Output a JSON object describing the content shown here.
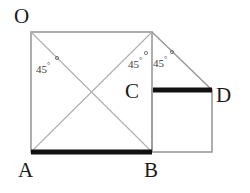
{
  "figure": {
    "type": "geometry-diagram",
    "colors": {
      "thin_line": "#9a9a9a",
      "thick_line": "#111111",
      "label_text": "#1a1a1a",
      "angle_text": "#3d3d3d",
      "background": "#ffffff"
    },
    "vertex_labels": [
      {
        "id": "O",
        "text": "O"
      },
      {
        "id": "A",
        "text": "A"
      },
      {
        "id": "B",
        "text": "B"
      },
      {
        "id": "C",
        "text": "C"
      },
      {
        "id": "D",
        "text": "D"
      }
    ],
    "angle_labels": [
      {
        "id": "angle-1",
        "value": "45",
        "unit": "°"
      },
      {
        "id": "angle-2",
        "value": "45",
        "unit": "°"
      },
      {
        "id": "angle-3",
        "value": "45",
        "unit": "°"
      }
    ],
    "geometry": {
      "big_square": {
        "x1": 31,
        "y1": 32,
        "x2": 152,
        "y2": 152
      },
      "small_square": {
        "x1": 152,
        "y1": 90,
        "x2": 212,
        "y2": 152
      },
      "triangle": {
        "apex_x": 152,
        "apex_y": 32,
        "right_x": 212,
        "right_y": 90
      },
      "diagonals": [
        {
          "x1": 31,
          "y1": 32,
          "x2": 152,
          "y2": 152
        },
        {
          "x1": 152,
          "y1": 32,
          "x2": 31,
          "y2": 152
        }
      ],
      "thick_segments": [
        {
          "name": "segment-AB",
          "x1": 31,
          "y1": 152,
          "x2": 152,
          "y2": 152
        },
        {
          "name": "segment-CD",
          "x1": 152,
          "y1": 90,
          "x2": 212,
          "y2": 90
        }
      ]
    }
  }
}
